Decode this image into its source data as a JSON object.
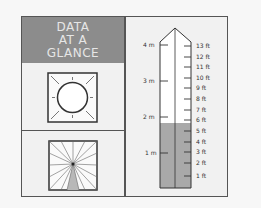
{
  "header": {
    "lines": [
      "DATA",
      "AT A",
      "GLANCE"
    ]
  },
  "icons": {
    "top": "sun-icon",
    "bottom": "rays-sector-icon"
  },
  "gauge": {
    "metric_labels": [
      {
        "label": "4 m",
        "y": 45
      },
      {
        "label": "3 m",
        "y": 81
      },
      {
        "label": "2 m",
        "y": 117
      },
      {
        "label": "1 m",
        "y": 153
      }
    ],
    "feet_labels": [
      {
        "label": "13 ft",
        "y": 46
      },
      {
        "label": "12 ft",
        "y": 57
      },
      {
        "label": "11 ft",
        "y": 67
      },
      {
        "label": "10 ft",
        "y": 78
      },
      {
        "label": "9 ft",
        "y": 88
      },
      {
        "label": "8 ft",
        "y": 99
      },
      {
        "label": "7 ft",
        "y": 110
      },
      {
        "label": "6 ft",
        "y": 120
      },
      {
        "label": "5 ft",
        "y": 131
      },
      {
        "label": "4 ft",
        "y": 142
      },
      {
        "label": "3 ft",
        "y": 152
      },
      {
        "label": "2 ft",
        "y": 163
      },
      {
        "label": "1 ft",
        "y": 176
      }
    ],
    "fill_level": "between 5 ft and 6 ft (~1.8 m)",
    "fill_color": "#a9a9a9"
  }
}
